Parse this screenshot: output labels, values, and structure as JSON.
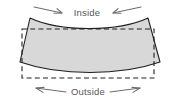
{
  "figure": {
    "type": "technical-diagram",
    "labels": {
      "top": "Inside",
      "bottom": "Outside"
    },
    "colors": {
      "shape_fill": "#d8d8d8",
      "shape_stroke": "#231f20",
      "dashed_stroke": "#231f20",
      "arrow_stroke": "#6e6e70",
      "label_text": "#58585a",
      "background": "#ffffff"
    },
    "shape": {
      "name": "bowed-panel",
      "corners": {
        "top_left": [
          30,
          18
        ],
        "top_right": [
          148,
          18
        ],
        "bottom_right": [
          160,
          62
        ],
        "bottom_left": [
          20,
          62
        ]
      },
      "top_edge_curve": "concave-down-dip",
      "bottom_edge_curve": "concave-up-rise"
    },
    "reference_rectangle": {
      "name": "dashed-reference-rectangle",
      "style": "dashed",
      "x": 22,
      "y": 29,
      "width": 132,
      "height": 49
    },
    "annotations": [
      {
        "name": "inside-arrow-left",
        "direction": "right",
        "meaning": "compression inward"
      },
      {
        "name": "inside-arrow-right",
        "direction": "left",
        "meaning": "compression inward"
      },
      {
        "name": "outside-arrow-left",
        "direction": "left",
        "meaning": "extension outward"
      },
      {
        "name": "outside-arrow-right",
        "direction": "right",
        "meaning": "extension outward"
      }
    ]
  }
}
